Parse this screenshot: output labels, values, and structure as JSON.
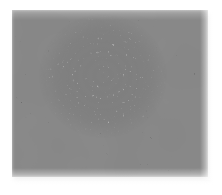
{
  "image": {
    "title": "Grayscale noise texture with bright elliptical region",
    "width": 222,
    "height": 195,
    "background_color": "#ffffff",
    "caption": ""
  },
  "panel": {
    "name": "texture-panel",
    "left": 12,
    "top": 10,
    "width": 196,
    "height": 167,
    "base_color": "#8d8d8d",
    "surround_color": "#888888",
    "shadow_color": "#e8e8e8",
    "description": "Rectangular field of fine short-stroke grayscale noise"
  },
  "ellipse": {
    "name": "bright-ellipse-region",
    "center_x": 103,
    "center_y": 76,
    "radius_x": 64,
    "radius_y": 62,
    "fill_color": "#dedede",
    "highlight_color": "#e8e8e8",
    "edge_softness_px": 22,
    "description": "Large soft-edged bright elliptical patch of higher-contrast texture"
  },
  "texture": {
    "grain_type": "short-stroke worm noise",
    "grain_scale": 0.9,
    "dark_value": "#6f6f6f",
    "mid_value": "#9a9a9a",
    "light_value": "#efefef",
    "octaves": 3
  },
  "colors": {
    "page_background": "#ffffff",
    "panel_gray": "#8d8d8d",
    "bright_core": "#e2e2e2",
    "dark_grain": "#6b6b6b",
    "shadow_band": "#e8e8e8"
  }
}
